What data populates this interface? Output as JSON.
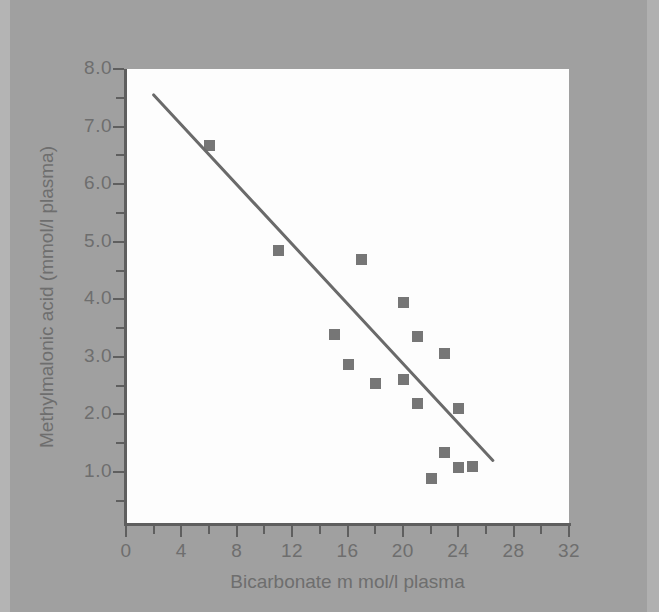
{
  "figure": {
    "background_color": "#9d9d9d",
    "panel_color": "#fdfdfd",
    "axis_color": "#5f5f5f",
    "text_color": "#6e6e6e",
    "marker_color": "#767676",
    "line_color": "#6a6a6a"
  },
  "chart_data": {
    "type": "scatter",
    "title": "",
    "xlabel": "Bicarbonate m mol/l plasma",
    "ylabel": "Methylmalonic acid (mmol/l plasma)",
    "xlim": [
      0,
      32
    ],
    "ylim": [
      0,
      8
    ],
    "xticks": [
      0,
      4,
      8,
      12,
      16,
      20,
      24,
      28,
      32
    ],
    "xticklabels": [
      "0",
      "4",
      "8",
      "12",
      "16",
      "20",
      "24",
      "28",
      "32"
    ],
    "xminorticks": [
      2,
      6,
      10,
      14,
      18,
      22,
      26,
      30
    ],
    "yticks": [
      1.0,
      2.0,
      3.0,
      4.0,
      5.0,
      6.0,
      7.0,
      8.0
    ],
    "yticklabels": [
      "1.0",
      "2.0",
      "3.0",
      "4.0",
      "5.0",
      "6.0",
      "7.0",
      "8.0"
    ],
    "yminorticks": [
      0.5,
      1.5,
      2.5,
      3.5,
      4.5,
      5.5,
      6.5,
      7.5
    ],
    "grid": false,
    "legend": null,
    "marker": "square",
    "series": [
      {
        "name": "patients",
        "points": [
          {
            "x": 6.0,
            "y": 6.68
          },
          {
            "x": 11.0,
            "y": 4.85
          },
          {
            "x": 17.0,
            "y": 4.7
          },
          {
            "x": 20.0,
            "y": 3.95
          },
          {
            "x": 15.0,
            "y": 3.39
          },
          {
            "x": 21.0,
            "y": 3.37
          },
          {
            "x": 23.0,
            "y": 3.07
          },
          {
            "x": 16.0,
            "y": 2.87
          },
          {
            "x": 20.0,
            "y": 2.62
          },
          {
            "x": 18.0,
            "y": 2.55
          },
          {
            "x": 21.0,
            "y": 2.2
          },
          {
            "x": 24.0,
            "y": 2.12
          },
          {
            "x": 23.0,
            "y": 1.34
          },
          {
            "x": 24.0,
            "y": 1.08
          },
          {
            "x": 25.0,
            "y": 1.1
          },
          {
            "x": 22.0,
            "y": 0.89
          }
        ]
      }
    ],
    "trendline": {
      "type": "linear-fit",
      "x_start": 2.0,
      "y_start": 7.55,
      "x_end": 26.5,
      "y_end": 1.2
    }
  }
}
